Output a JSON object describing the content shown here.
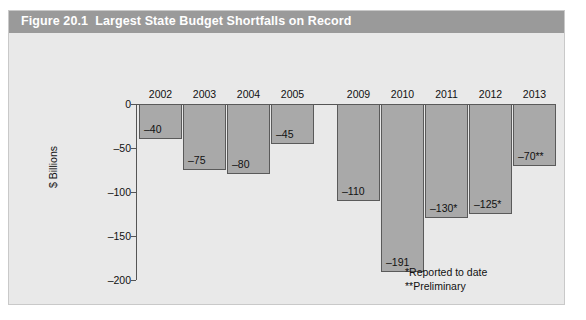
{
  "figure": {
    "title": "Figure 20.1  Largest State Budget Shortfalls on Record",
    "title_bar_color": "#9a9a9a",
    "background_color": "#e9e9e9",
    "bar_color": "#a9a9a9",
    "bar_border_color": "#5a5a5a"
  },
  "footnotes": [
    "*Reported to date",
    "**Preliminary"
  ],
  "chart_data": {
    "type": "bar",
    "title": "Figure 20.1  Largest State Budget Shortfalls on Record",
    "xlabel": "",
    "ylabel": "$ Billions",
    "categories": [
      "2002",
      "2003",
      "2004",
      "2005",
      "2009",
      "2010",
      "2011",
      "2012",
      "2013"
    ],
    "values": [
      -40,
      -75,
      -80,
      -45,
      -110,
      -191,
      -130,
      -125,
      -70
    ],
    "value_labels": [
      "–40",
      "–75",
      "–80",
      "–45",
      "–110",
      "–191",
      "–130*",
      "–125*",
      "–70**"
    ],
    "ylim": [
      -200,
      0
    ],
    "yticks": [
      0,
      -50,
      -100,
      -150,
      -200
    ],
    "ytick_labels": [
      "0",
      "–50",
      "–100",
      "–150",
      "–200"
    ],
    "grid": false,
    "legend": "none",
    "orientation": "vertical-downward",
    "gap_after_category": "2005",
    "notes": [
      "*Reported to date",
      "**Preliminary"
    ]
  }
}
